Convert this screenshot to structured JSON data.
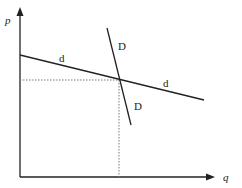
{
  "diagram": {
    "type": "kinked demand curve",
    "axes": {
      "y_label": "p",
      "x_label": "q"
    },
    "curves": [
      {
        "name": "d",
        "description": "flatter (elastic) demand curve",
        "labels": [
          "d",
          "d"
        ]
      },
      {
        "name": "D",
        "description": "steeper (inelastic) demand curve",
        "labels": [
          "D",
          "D"
        ]
      }
    ],
    "guides": {
      "horizontal_dotted": "price at intersection",
      "vertical_dotted": "quantity at intersection"
    },
    "colors": {
      "line": "#222222",
      "dotted": "#777777",
      "background": "#ffffff"
    }
  }
}
